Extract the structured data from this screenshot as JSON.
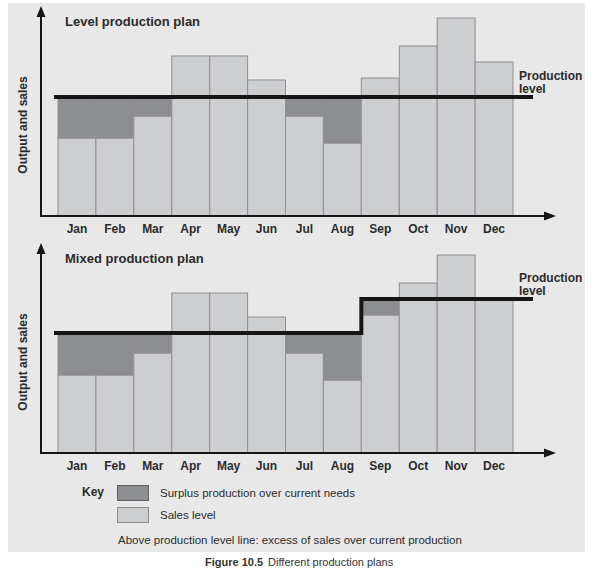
{
  "colors": {
    "page_bg": "#ffffff",
    "panel_bg": "#e8e8e8",
    "sales_fill": "#cdced0",
    "surplus_fill": "#8d8e92",
    "bar_border": "#8f9094",
    "line_color": "#161616",
    "text_color": "#2b2b2b"
  },
  "chart_data": [
    {
      "type": "bar",
      "title": "Level production plan",
      "ylabel": "Output and sales",
      "xlabel": "",
      "categories": [
        "Jan",
        "Feb",
        "Mar",
        "Apr",
        "May",
        "Jun",
        "Jul",
        "Aug",
        "Sep",
        "Oct",
        "Nov",
        "Dec"
      ],
      "series": [
        {
          "name": "Sales level",
          "values": [
            78,
            78,
            100,
            160,
            160,
            136,
            100,
            73,
            138,
            170,
            198,
            154
          ]
        }
      ],
      "production_line": {
        "label": "Production level",
        "segments": [
          {
            "from": "Jan",
            "to": "Dec",
            "level": 119
          }
        ]
      },
      "value_scale": "relative units (axis unlabeled, no numeric ticks)",
      "legend_position": "shared key below both charts",
      "grid": false,
      "notes": "Dark band between sales top and the line = surplus production over current needs; bar portions above the line = excess of sales over current production"
    },
    {
      "type": "bar",
      "title": "Mixed production plan",
      "ylabel": "Output and sales",
      "xlabel": "",
      "categories": [
        "Jan",
        "Feb",
        "Mar",
        "Apr",
        "May",
        "Jun",
        "Jul",
        "Aug",
        "Sep",
        "Oct",
        "Nov",
        "Dec"
      ],
      "series": [
        {
          "name": "Sales level",
          "values": [
            78,
            78,
            100,
            160,
            160,
            136,
            100,
            73,
            138,
            170,
            198,
            154
          ]
        }
      ],
      "production_line": {
        "label": "Production level",
        "segments": [
          {
            "from": "Jan",
            "to": "Aug",
            "level": 120
          },
          {
            "from": "Sep",
            "to": "Dec",
            "level": 154
          }
        ]
      },
      "value_scale": "relative units (axis unlabeled, no numeric ticks)",
      "legend_position": "shared key below both charts",
      "grid": false,
      "notes": "Production level line steps up between Aug and Sep"
    }
  ],
  "key": {
    "title": "Key",
    "items": [
      {
        "name": "surplus",
        "label": "Surplus production over current needs"
      },
      {
        "name": "sales",
        "label": "Sales level"
      }
    ],
    "note": "Above production level line: excess of sales over current production"
  },
  "caption": {
    "prefix": "Figure 10.5",
    "text": "Different production plans"
  }
}
